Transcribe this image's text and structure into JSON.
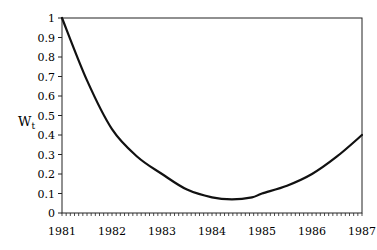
{
  "chart_data": {
    "type": "line",
    "title": "",
    "xlabel": "",
    "ylabel": "W_t",
    "ylabel_main": "W",
    "ylabel_sub": "t",
    "xlim": [
      1981,
      1987
    ],
    "ylim": [
      0,
      1
    ],
    "grid": false,
    "legend": null,
    "x_ticks": [
      "1981",
      "1982",
      "1983",
      "1984",
      "1985",
      "1986",
      "1987"
    ],
    "y_ticks": [
      "0",
      "0.1",
      "0.2",
      "0.3",
      "0.4",
      "0.5",
      "0.6",
      "0.7",
      "0.8",
      "0.9",
      "1"
    ],
    "series": [
      {
        "name": "W_t",
        "x": [
          1981.0,
          1981.5,
          1982.0,
          1982.5,
          1983.0,
          1983.5,
          1984.0,
          1984.4,
          1984.8,
          1985.0,
          1985.5,
          1986.0,
          1986.5,
          1987.0
        ],
        "values": [
          1.0,
          0.68,
          0.43,
          0.29,
          0.2,
          0.12,
          0.08,
          0.07,
          0.08,
          0.1,
          0.14,
          0.2,
          0.29,
          0.4
        ]
      }
    ]
  }
}
